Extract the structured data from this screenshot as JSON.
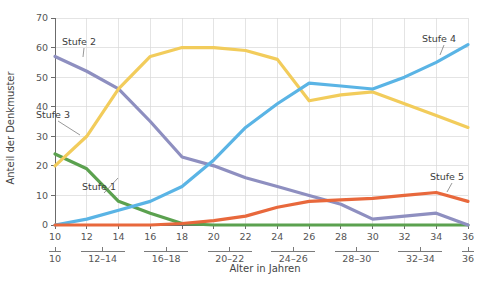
{
  "chart_data": {
    "type": "line",
    "title": "",
    "xlabel": "Alter in Jahren",
    "ylabel": "Anteil der Denkmuster",
    "xlim": [
      10,
      36
    ],
    "ylim": [
      0,
      70
    ],
    "grid": true,
    "legend_position": "inline-annotations",
    "x": [
      10,
      12,
      14,
      16,
      18,
      20,
      22,
      24,
      26,
      28,
      30,
      32,
      34,
      36
    ],
    "xtick_labels": [
      "10",
      "12",
      "14",
      "16",
      "18",
      "20",
      "22",
      "24",
      "26",
      "28",
      "30",
      "32",
      "34",
      "36"
    ],
    "ytick_labels": [
      "0",
      "10",
      "20",
      "30",
      "40",
      "50",
      "60",
      "70"
    ],
    "ytick_values": [
      0,
      10,
      20,
      30,
      40,
      50,
      60,
      70
    ],
    "group_labels": [
      "10",
      "12–14",
      "16–18",
      "20–22",
      "24–26",
      "28–30",
      "32–34",
      "36"
    ],
    "series": [
      {
        "name": "Stufe 1",
        "color": "#5ba14f",
        "values": [
          24,
          19,
          8,
          4,
          0.5,
          0,
          0,
          0,
          0,
          0,
          0,
          0,
          0,
          0
        ],
        "annotation": {
          "label": "Stufe 1",
          "x": 82,
          "y": 190,
          "leader_to_x": 118,
          "leader_to_y": 178
        }
      },
      {
        "name": "Stufe 2",
        "color": "#8e8fc0",
        "values": [
          57,
          52,
          46,
          35,
          23,
          20,
          16,
          13,
          10,
          7,
          2,
          3,
          4,
          0
        ],
        "annotation": {
          "label": "Stufe 2",
          "x": 62,
          "y": 45,
          "leader_to_x": 83,
          "leader_to_y": 57
        }
      },
      {
        "name": "Stufe 3",
        "color": "#f2cc5b",
        "values": [
          20,
          30,
          46,
          57,
          60,
          60,
          59,
          56,
          42,
          44,
          45,
          41,
          37,
          33
        ],
        "annotation": {
          "label": "Stufe 3",
          "x": 36,
          "y": 118,
          "leader_to_x": 80,
          "leader_to_y": 135
        }
      },
      {
        "name": "Stufe 4",
        "color": "#5ab4e5",
        "values": [
          0,
          2,
          5,
          8,
          13,
          22,
          33,
          41,
          48,
          47,
          46,
          50,
          55,
          61
        ],
        "annotation": {
          "label": "Stufe 4",
          "x": 422,
          "y": 42,
          "leader_to_x": 440,
          "leader_to_y": 55
        }
      },
      {
        "name": "Stufe 5",
        "color": "#e8683c",
        "values": [
          0,
          0,
          0,
          0,
          0.5,
          1.5,
          3,
          6,
          8,
          8.5,
          9,
          10,
          11,
          8
        ],
        "annotation": {
          "label": "Stufe 5",
          "x": 430,
          "y": 180,
          "leader_to_x": 447,
          "leader_to_y": 192
        }
      }
    ]
  }
}
